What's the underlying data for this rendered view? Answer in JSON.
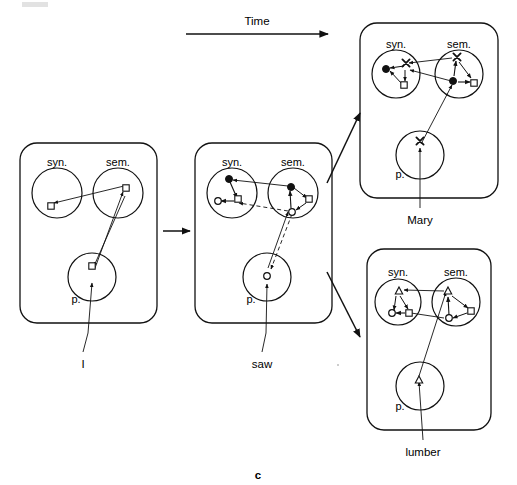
{
  "figure": {
    "caption": "c",
    "time_axis_label": "Time",
    "panel_region_labels": {
      "syntax": "syn.",
      "semantics": "sem.",
      "phonology": "p."
    },
    "word_labels": [
      "I",
      "saw",
      "Mary",
      "lumber"
    ],
    "colors": {
      "ink": "#111111",
      "background": "#ffffff",
      "artifact_gray": "#d8d8d8"
    },
    "marker_glyphs": {
      "filled_circle": "●",
      "open_circle": "○",
      "open_square": "□",
      "cross": "x",
      "open_triangle": "△"
    }
  },
  "panels": [
    {
      "id": "panel-1",
      "word": "I",
      "order": 1,
      "regions": [
        {
          "name": "syn.",
          "label": "syn.",
          "nodes": [
            {
              "type": "open_square",
              "id": "syn-sq"
            }
          ]
        },
        {
          "name": "sem.",
          "label": "sem.",
          "nodes": [
            {
              "type": "open_square",
              "id": "sem-sq"
            }
          ]
        },
        {
          "name": "p.",
          "label": "p.",
          "nodes": [
            {
              "type": "open_square",
              "id": "p-sq"
            }
          ]
        }
      ],
      "links": [
        {
          "from": "sem-sq",
          "to": "syn-sq",
          "style": "solid",
          "arrow": "end"
        },
        {
          "from": "p-sq",
          "to": "sem-sq",
          "style": "solid",
          "arrow": "end"
        },
        {
          "from": "sem-sq",
          "to": "p-sq",
          "style": "solid",
          "arrow": "end"
        },
        {
          "from": "input",
          "to": "p-sq",
          "style": "solid",
          "arrow": "end"
        }
      ]
    },
    {
      "id": "panel-2",
      "word": "saw",
      "order": 2,
      "regions": [
        {
          "name": "syn.",
          "label": "syn.",
          "nodes": [
            {
              "type": "filled_circle",
              "id": "syn-dot"
            },
            {
              "type": "open_circle",
              "id": "syn-circ"
            },
            {
              "type": "open_square",
              "id": "syn-sq"
            }
          ]
        },
        {
          "name": "sem.",
          "label": "sem.",
          "nodes": [
            {
              "type": "filled_circle",
              "id": "sem-dot"
            },
            {
              "type": "open_square",
              "id": "sem-sq"
            },
            {
              "type": "open_circle",
              "id": "sem-circ"
            }
          ]
        },
        {
          "name": "p.",
          "label": "p.",
          "nodes": [
            {
              "type": "open_circle",
              "id": "p-circ"
            }
          ]
        }
      ],
      "links": [
        {
          "from": "sem-dot",
          "to": "syn-dot",
          "style": "solid",
          "arrow": "end"
        },
        {
          "from": "syn-dot",
          "to": "syn-sq",
          "style": "solid",
          "arrow": "end"
        },
        {
          "from": "syn-sq",
          "to": "syn-circ",
          "style": "solid",
          "arrow": "end"
        },
        {
          "from": "sem-dot",
          "to": "sem-sq",
          "style": "solid",
          "arrow": "end"
        },
        {
          "from": "sem-sq",
          "to": "sem-circ",
          "style": "solid",
          "arrow": "end"
        },
        {
          "from": "sem-circ",
          "to": "sem-dot",
          "style": "solid",
          "arrow": "end"
        },
        {
          "from": "sem-circ",
          "to": "syn-sq",
          "style": "dashed",
          "arrow": "end"
        },
        {
          "from": "p-circ",
          "to": "sem-circ",
          "style": "solid",
          "arrow": "end"
        },
        {
          "from": "sem-circ",
          "to": "p-circ",
          "style": "dashed",
          "arrow": "end"
        },
        {
          "from": "input",
          "to": "p-circ",
          "style": "solid",
          "arrow": "end"
        }
      ]
    },
    {
      "id": "panel-3",
      "word": "Mary",
      "order": 3,
      "branch": "upper",
      "regions": [
        {
          "name": "syn.",
          "label": "syn.",
          "nodes": [
            {
              "type": "filled_circle",
              "id": "syn-dot"
            },
            {
              "type": "cross",
              "id": "syn-x"
            },
            {
              "type": "open_square",
              "id": "syn-sq"
            }
          ]
        },
        {
          "name": "sem.",
          "label": "sem.",
          "nodes": [
            {
              "type": "cross",
              "id": "sem-x"
            },
            {
              "type": "filled_circle",
              "id": "sem-dot"
            },
            {
              "type": "open_square",
              "id": "sem-sq"
            }
          ]
        },
        {
          "name": "p.",
          "label": "p.",
          "nodes": [
            {
              "type": "cross",
              "id": "p-x"
            }
          ]
        }
      ],
      "links": [
        {
          "from": "syn-x",
          "to": "syn-dot",
          "style": "solid",
          "arrow": "end"
        },
        {
          "from": "syn-x",
          "to": "syn-sq",
          "style": "solid",
          "arrow": "end"
        },
        {
          "from": "syn-sq",
          "to": "syn-dot",
          "style": "solid",
          "arrow": "end"
        },
        {
          "from": "sem-x",
          "to": "syn-x",
          "style": "solid",
          "arrow": "end"
        },
        {
          "from": "sem-dot",
          "to": "syn-x",
          "style": "solid",
          "arrow": "end"
        },
        {
          "from": "sem-dot",
          "to": "sem-x",
          "style": "solid",
          "arrow": "end"
        },
        {
          "from": "sem-x",
          "to": "sem-sq",
          "style": "solid",
          "arrow": "end"
        },
        {
          "from": "sem-dot",
          "to": "sem-sq",
          "style": "solid",
          "arrow": "end"
        },
        {
          "from": "p-x",
          "to": "sem-dot",
          "style": "solid",
          "arrow": "end"
        },
        {
          "from": "input",
          "to": "p-x",
          "style": "solid",
          "arrow": "end"
        }
      ]
    },
    {
      "id": "panel-4",
      "word": "lumber",
      "order": 3,
      "branch": "lower",
      "regions": [
        {
          "name": "syn.",
          "label": "syn.",
          "nodes": [
            {
              "type": "open_triangle",
              "id": "syn-tri"
            },
            {
              "type": "open_circle",
              "id": "syn-circ"
            },
            {
              "type": "open_square",
              "id": "syn-sq"
            }
          ]
        },
        {
          "name": "sem.",
          "label": "sem.",
          "nodes": [
            {
              "type": "open_triangle",
              "id": "sem-tri"
            },
            {
              "type": "open_square",
              "id": "sem-sq"
            },
            {
              "type": "open_circle",
              "id": "sem-circ"
            }
          ]
        },
        {
          "name": "p.",
          "label": "p.",
          "nodes": [
            {
              "type": "open_triangle",
              "id": "p-tri"
            }
          ]
        }
      ],
      "links": [
        {
          "from": "sem-tri",
          "to": "syn-tri",
          "style": "solid",
          "arrow": "end"
        },
        {
          "from": "syn-tri",
          "to": "syn-circ",
          "style": "solid",
          "arrow": "end"
        },
        {
          "from": "syn-tri",
          "to": "syn-sq",
          "style": "solid",
          "arrow": "end"
        },
        {
          "from": "syn-sq",
          "to": "syn-circ",
          "style": "solid",
          "arrow": "end"
        },
        {
          "from": "sem-circ",
          "to": "syn-sq",
          "style": "solid",
          "arrow": "end"
        },
        {
          "from": "sem-tri",
          "to": "sem-sq",
          "style": "solid",
          "arrow": "end"
        },
        {
          "from": "sem-sq",
          "to": "sem-circ",
          "style": "solid",
          "arrow": "end"
        },
        {
          "from": "sem-circ",
          "to": "sem-tri",
          "style": "solid",
          "arrow": "end"
        },
        {
          "from": "p-tri",
          "to": "sem-tri",
          "style": "solid",
          "arrow": "end"
        },
        {
          "from": "input",
          "to": "p-tri",
          "style": "solid",
          "arrow": "end"
        }
      ]
    }
  ],
  "transitions": [
    {
      "id": "t1",
      "from": "panel-1",
      "to": "panel-2",
      "style": "solid"
    },
    {
      "id": "t2",
      "from": "panel-2",
      "to": "panel-3",
      "style": "solid"
    },
    {
      "id": "t3",
      "from": "panel-2",
      "to": "panel-4",
      "style": "solid"
    }
  ]
}
